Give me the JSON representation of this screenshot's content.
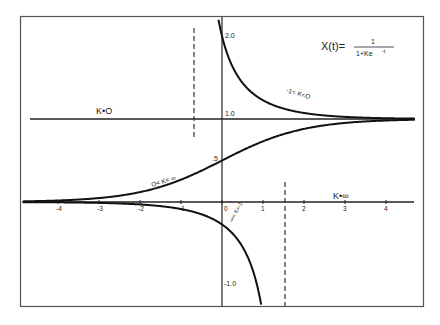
{
  "chart_data": {
    "type": "line",
    "title": "",
    "equation": {
      "lhs": "X(t)=",
      "numerator": "1",
      "denominator": "1+Ke",
      "exponent": "-t"
    },
    "xlabel": "",
    "ylabel": "",
    "xlim": [
      -4.9,
      4.8
    ],
    "ylim": [
      -1.25,
      2.2
    ],
    "grid": false,
    "x_ticks": [
      -4,
      -3,
      -2,
      -1,
      0,
      1,
      2,
      3,
      4
    ],
    "x_tick_labels": [
      "-4",
      "-3",
      "-2",
      "-1",
      "0",
      "1",
      "2",
      "3",
      "4"
    ],
    "y_tick_labels": [
      {
        "value": 2.0,
        "label": "2.0"
      },
      {
        "value": 1.0,
        "label": "1.0"
      },
      {
        "value": 0.5,
        "label": ".5"
      },
      {
        "value": -1.0,
        "label": "-1.0"
      }
    ],
    "series": [
      {
        "name": "K=0",
        "label": "K•O",
        "K": 0,
        "description": "horizontal line X=1"
      },
      {
        "name": "-1<K<0",
        "label": "-1< K<O",
        "K": -0.5,
        "description": "curve from vertical asymptote down to X=1"
      },
      {
        "name": "0<K<inf",
        "label": "O< K< ∞",
        "K": 1,
        "description": "logistic curve rising from 0 to 1, X(0)=0.5"
      },
      {
        "name": "K=inf",
        "label": "K•∞",
        "K": "inf",
        "description": "horizontal line X=0"
      },
      {
        "name": "-inf<K<-1",
        "label": "-∞< K<-1",
        "K": -4.7,
        "description": "curve below X=0 going to -infinity at asymptote"
      }
    ],
    "asymptotes": [
      {
        "x": -0.69,
        "style": "dashed",
        "for": "-1<K<0"
      },
      {
        "x": 1.55,
        "style": "dashed",
        "for": "-inf<K<-1"
      }
    ]
  }
}
